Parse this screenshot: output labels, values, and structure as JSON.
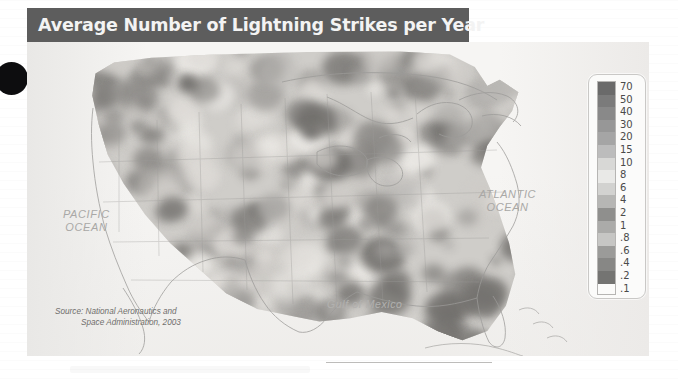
{
  "figure": {
    "title": "Average Number of Lightning Strikes per Year",
    "source_line1": "Source: National Aeronautics and",
    "source_line2": "Space Administration, 2003",
    "labels": {
      "pacific": "PACIFIC\nOCEAN",
      "pacific_l1": "PACIFIC",
      "pacific_l2": "OCEAN",
      "atlantic_l1": "ATLANTIC",
      "atlantic_l2": "OCEAN",
      "gulf": "Gulf of Mexico"
    },
    "colors": {
      "banner_bg": "#5d5d5d",
      "banner_text": "#f3f3f3",
      "land_base": "#cfcdc9",
      "ocean": "#f0efed",
      "label_text": "#a9a8a6",
      "legend_border": "#c9c8c6"
    }
  },
  "legend": {
    "title": "",
    "labels": [
      "70",
      "50",
      "40",
      "30",
      "20",
      "15",
      "10",
      "8",
      "6",
      "4",
      "2",
      "1",
      ".8",
      ".6",
      ".4",
      ".2",
      ".1"
    ],
    "swatch_colors": [
      "#6b6b6b",
      "#7d7d7d",
      "#8b8b8b",
      "#999999",
      "#a7a7a7",
      "#bdbdbd",
      "#d6d6d6",
      "#e6e6e4",
      "#cfcfcd",
      "#b4b4b2",
      "#8e8e8c",
      "#aaaaa8",
      "#c4c4c2",
      "#9a9a98",
      "#868684",
      "#74747 2"
    ]
  },
  "chart_data": {
    "type": "heatmap",
    "title": "Average Number of Lightning Strikes per Year",
    "subtitle": "",
    "xlabel": "",
    "ylabel": "",
    "units": "flashes per square kilometer per year",
    "source": "Source: National Aeronautics and Space Administration, 2003",
    "legend_position": "right",
    "grid": false,
    "scale_type": "logarithmic-binned",
    "legend_breaks": [
      70,
      50,
      40,
      30,
      20,
      15,
      10,
      8,
      6,
      4,
      2,
      1,
      0.8,
      0.6,
      0.4,
      0.2,
      0.1
    ],
    "geographic_labels": [
      "PACIFIC OCEAN",
      "ATLANTIC OCEAN",
      "Gulf of Mexico"
    ],
    "regions": [
      {
        "name": "Florida",
        "value": 30,
        "note": "highest density, dark tone"
      },
      {
        "name": "Gulf Coast / Louisiana",
        "value": 20
      },
      {
        "name": "Southeast (Georgia, Alabama)",
        "value": 15
      },
      {
        "name": "Texas Gulf Coast",
        "value": 15
      },
      {
        "name": "Great Plains (Oklahoma, Kansas)",
        "value": 10
      },
      {
        "name": "Midwest (Missouri, Illinois)",
        "value": 8
      },
      {
        "name": "Northeast (New England)",
        "value": 4
      },
      {
        "name": "Great Lakes",
        "value": 4
      },
      {
        "name": "Rocky Mountains / Colorado",
        "value": 6
      },
      {
        "name": "Arizona / New Mexico",
        "value": 6
      },
      {
        "name": "Great Basin / Nevada",
        "value": 1
      },
      {
        "name": "Pacific Northwest",
        "value": 0.4
      },
      {
        "name": "Northern California coast",
        "value": 0.2
      },
      {
        "name": "Southern California coast",
        "value": 0.2
      }
    ]
  }
}
